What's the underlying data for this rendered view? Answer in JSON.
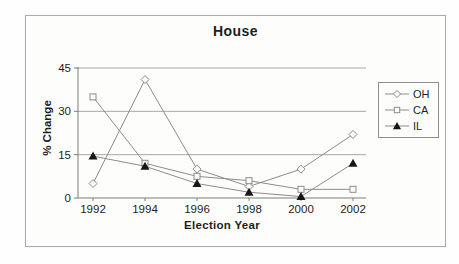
{
  "chart": {
    "title": "House",
    "xlabel": "Election Year",
    "ylabel": "% Change"
  },
  "chart_data": {
    "type": "line",
    "title": "House",
    "xlabel": "Election Year",
    "ylabel": "% Change",
    "categories": [
      "1992",
      "1994",
      "1996",
      "1998",
      "2000",
      "2002"
    ],
    "series": [
      {
        "name": "OH",
        "marker": "open-diamond",
        "values": [
          5,
          41,
          10,
          4,
          10,
          22
        ]
      },
      {
        "name": "CA",
        "marker": "open-square",
        "values": [
          35,
          12,
          7.5,
          6,
          3,
          3
        ]
      },
      {
        "name": "IL",
        "marker": "filled-triangle",
        "values": [
          14.5,
          11,
          5,
          2,
          0.5,
          12
        ]
      }
    ],
    "ylim": [
      0,
      45
    ],
    "yticks": [
      0,
      15,
      30,
      45
    ],
    "grid": true,
    "legend_position": "right"
  },
  "colors": {
    "line": "#8c8c8c",
    "grid": "#a8a8a8",
    "axis": "#7d7d7d",
    "text": "#1e1e1e",
    "marker_fill": "#fbfbfb",
    "triangle_fill": "#161616",
    "frame_border": "#ababab",
    "legend_border": "#8f8f8f",
    "background": "#fdfdfb"
  }
}
